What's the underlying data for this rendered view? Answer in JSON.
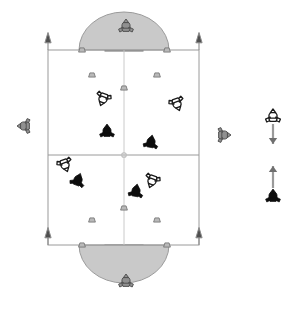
{
  "scene": {
    "title": "Robot Soccer Field Simulation",
    "background_color": "#ffffff",
    "width": 300,
    "height": 314
  },
  "field": {
    "name": "playing-field",
    "left": 48,
    "top": 50,
    "right": 199,
    "bottom": 245,
    "line_color": "#9a9a9a",
    "line_width": 1,
    "fill_color": "#ffffff",
    "halfway_line_y": 155,
    "center_vertical_line_x": 124,
    "center_mark_color": "#bdbdbd"
  },
  "goals": [
    {
      "name": "goal-top",
      "x": 105,
      "y": 38,
      "width": 38,
      "height": 13,
      "fill": "#8f8f8f",
      "stroke": "#6b6b6b"
    },
    {
      "name": "goal-bottom",
      "x": 105,
      "y": 245,
      "width": 38,
      "height": 15,
      "fill": "#8f8f8f",
      "stroke": "#6b6b6b"
    }
  ],
  "penalty_arcs": [
    {
      "name": "penalty-arc-top",
      "center_x": 124,
      "center_y": 50,
      "radius_x": 45,
      "radius_y": 38,
      "direction": "down",
      "fill": "#c9c9c9",
      "stroke": "#9a9a9a"
    },
    {
      "name": "penalty-arc-bottom",
      "center_x": 124,
      "center_y": 245,
      "radius_x": 45,
      "radius_y": 38,
      "direction": "up",
      "fill": "#c9c9c9",
      "stroke": "#9a9a9a"
    }
  ],
  "corner_flags": [
    {
      "name": "corner-flag-top-left",
      "x": 48,
      "y": 50
    },
    {
      "name": "corner-flag-top-right",
      "x": 199,
      "y": 50
    },
    {
      "name": "corner-flag-bottom-left",
      "x": 48,
      "y": 245
    },
    {
      "name": "corner-flag-bottom-right",
      "x": 199,
      "y": 245
    }
  ],
  "arc_markers": [
    {
      "name": "arc-marker-top-1",
      "x": 82,
      "y": 50,
      "rot": 0
    },
    {
      "name": "arc-marker-top-2",
      "x": 167,
      "y": 50,
      "rot": 0
    },
    {
      "name": "arc-marker-top-3",
      "x": 92,
      "y": 75,
      "rot": 0
    },
    {
      "name": "arc-marker-top-4",
      "x": 157,
      "y": 75,
      "rot": 0
    },
    {
      "name": "arc-marker-top-5",
      "x": 124,
      "y": 88,
      "rot": 0
    },
    {
      "name": "arc-marker-bottom-1",
      "x": 124,
      "y": 208,
      "rot": 0
    },
    {
      "name": "arc-marker-bottom-2",
      "x": 92,
      "y": 220,
      "rot": 0
    },
    {
      "name": "arc-marker-bottom-3",
      "x": 157,
      "y": 220,
      "rot": 0
    },
    {
      "name": "arc-marker-bottom-4",
      "x": 82,
      "y": 245,
      "rot": 0
    },
    {
      "name": "arc-marker-bottom-5",
      "x": 167,
      "y": 245,
      "rot": 0
    }
  ],
  "robots": [
    {
      "name": "robot-observer-top",
      "team": "gray",
      "x": 126,
      "y": 26,
      "rot": 0,
      "label": "observer top"
    },
    {
      "name": "robot-observer-bottom",
      "team": "gray",
      "x": 126,
      "y": 281,
      "rot": 0,
      "label": "observer bottom"
    },
    {
      "name": "robot-observer-left",
      "team": "gray",
      "x": 24,
      "y": 126,
      "rot": -90,
      "label": "observer left"
    },
    {
      "name": "robot-observer-right",
      "team": "gray",
      "x": 224,
      "y": 135,
      "rot": 90,
      "label": "observer right"
    },
    {
      "name": "robot-white-1",
      "team": "white",
      "x": 103,
      "y": 99,
      "rot": 200,
      "label": "white 1"
    },
    {
      "name": "robot-white-2",
      "team": "white",
      "x": 177,
      "y": 104,
      "rot": 160,
      "label": "white 2"
    },
    {
      "name": "robot-white-3",
      "team": "white",
      "x": 65,
      "y": 165,
      "rot": 160,
      "label": "white 3"
    },
    {
      "name": "robot-white-4",
      "team": "white",
      "x": 152,
      "y": 181,
      "rot": 200,
      "label": "white 4"
    },
    {
      "name": "robot-black-1",
      "team": "black",
      "x": 107,
      "y": 131,
      "rot": 0,
      "label": "black 1"
    },
    {
      "name": "robot-black-2",
      "team": "black",
      "x": 151,
      "y": 142,
      "rot": 10,
      "label": "black 2"
    },
    {
      "name": "robot-black-3",
      "team": "black",
      "x": 78,
      "y": 180,
      "rot": 20,
      "label": "black 3"
    },
    {
      "name": "robot-black-4",
      "team": "black",
      "x": 136,
      "y": 191,
      "rot": 10,
      "label": "black 4"
    }
  ],
  "legend": {
    "name": "team-direction-legend",
    "entries": [
      {
        "name": "legend-white-team",
        "robot_team": "white",
        "robot_x": 273,
        "robot_y": 116,
        "arrow_direction": "down",
        "arrow_x": 273,
        "arrow_y1": 124,
        "arrow_y2": 144,
        "arrow_color": "#9a9a9a",
        "description": "white team attacks downward"
      },
      {
        "name": "legend-black-team",
        "robot_team": "black",
        "robot_x": 273,
        "robot_y": 196,
        "arrow_direction": "up",
        "arrow_x": 273,
        "arrow_y1": 188,
        "arrow_y2": 166,
        "arrow_color": "#9a9a9a",
        "description": "black team attacks upward"
      }
    ]
  },
  "colors": {
    "black_robot": "#0d0d0d",
    "white_robot_stroke": "#1a1a1a",
    "white_robot_fill": "#ffffff",
    "gray_robot_fill": "#909090",
    "gray_robot_stroke": "#4a4a4a",
    "field_line": "#9a9a9a",
    "arc_fill": "#c9c9c9",
    "goal_fill": "#8f8f8f",
    "arrow_gray": "#9a9a9a",
    "arrow_dark": "#6f6f6f"
  }
}
